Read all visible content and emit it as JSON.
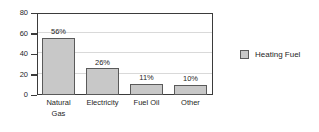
{
  "chart_data": {
    "type": "bar",
    "title": "",
    "xlabel": "",
    "ylabel": "",
    "categories": [
      "Natural Gas",
      "Electricity",
      "Fuel Oil",
      "Other"
    ],
    "values": [
      56,
      26,
      11,
      10
    ],
    "data_labels": [
      "56%",
      "26%",
      "11%",
      "10%"
    ],
    "ylim": [
      0,
      80
    ],
    "yticks": [
      0,
      20,
      40,
      60,
      80
    ],
    "ytick_labels": [
      "0",
      "20",
      "40",
      "60",
      "80"
    ],
    "grid": true,
    "grid_axis": "y",
    "legend": {
      "position": "right",
      "entries": [
        {
          "label": "Heating Fuel",
          "color": "#c8c8c8",
          "swatch_icon": "legend-swatch-icon"
        }
      ]
    },
    "series": [
      {
        "name": "Heating Fuel",
        "values": [
          56,
          26,
          11,
          10
        ],
        "color": "#c8c8c8"
      }
    ],
    "colors": {
      "bar_fill": "#c8c8c8",
      "bar_border": "#5a5a5a",
      "axis": "#3b3b3b",
      "gridline": "#d9d9d9",
      "text": "#262626",
      "background": "#ffffff"
    }
  },
  "category_label_lines": [
    [
      "Natural",
      "Gas"
    ],
    [
      "Electricity"
    ],
    [
      "Fuel Oil"
    ],
    [
      "Other"
    ]
  ]
}
